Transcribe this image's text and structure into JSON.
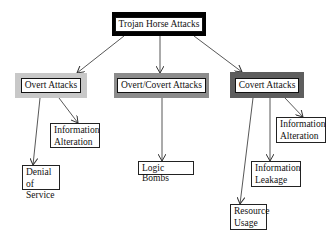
{
  "diagram": {
    "root": {
      "label": "Trojan Horse Attacks",
      "frame_color": "#000000"
    },
    "categories": [
      {
        "id": "overt",
        "label": "Overt Attacks",
        "frame_color": "#c8c8c8"
      },
      {
        "id": "overt_covert",
        "label": "Overt/Covert Attacks",
        "frame_color": "#8c8c8c"
      },
      {
        "id": "covert",
        "label": "Covert Attacks",
        "frame_color": "#5e5e5e"
      }
    ],
    "leaves": [
      {
        "parent": "overt",
        "line1": "Information",
        "line2": "Alteration"
      },
      {
        "parent": "overt",
        "line1": "Denial of",
        "line2": "Service"
      },
      {
        "parent": "overt_covert",
        "line1": "Logic Bombs",
        "line2": ""
      },
      {
        "parent": "covert",
        "line1": "Information",
        "line2": "Alteration"
      },
      {
        "parent": "covert",
        "line1": "Information",
        "line2": "Leakage"
      },
      {
        "parent": "covert",
        "line1": "Resource",
        "line2": "Usage"
      }
    ]
  }
}
